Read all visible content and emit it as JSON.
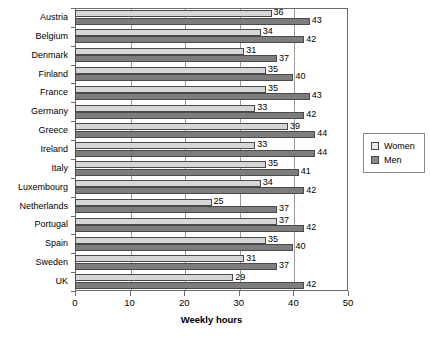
{
  "chart_data": {
    "type": "bar",
    "title": "",
    "xlabel": "Weekly hours",
    "ylabel": "",
    "xlim": [
      0,
      50
    ],
    "xticks": [
      0,
      10,
      20,
      30,
      40,
      50
    ],
    "grid": "vertical",
    "orientation": "horizontal",
    "legend_position": "right",
    "categories": [
      "Austria",
      "Belgium",
      "Denmark",
      "Finland",
      "France",
      "Germany",
      "Greece",
      "Ireland",
      "Italy",
      "Luxembourg",
      "Netherlands",
      "Portugal",
      "Spain",
      "Sweden",
      "UK"
    ],
    "series": [
      {
        "name": "Women",
        "color": "#d6d6d6",
        "values": [
          36,
          34,
          31,
          35,
          35,
          33,
          39,
          33,
          35,
          34,
          25,
          37,
          35,
          31,
          29
        ]
      },
      {
        "name": "Men",
        "color": "#7d7d7d",
        "values": [
          43,
          42,
          37,
          40,
          43,
          42,
          44,
          44,
          41,
          42,
          37,
          42,
          40,
          37,
          42
        ]
      }
    ]
  },
  "legend": {
    "items": [
      {
        "label": "Women",
        "swatch": "women"
      },
      {
        "label": "Men",
        "swatch": "men"
      }
    ]
  }
}
